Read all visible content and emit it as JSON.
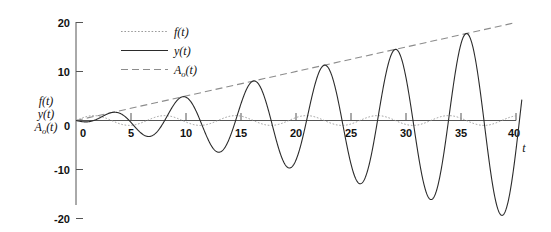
{
  "chart_data": {
    "type": "line",
    "title": "",
    "xlabel": "t",
    "ylabel": "f(t) y(t) A_o(t)",
    "ylabel_lines": [
      "f(t)",
      "y(t)",
      "A",
      "(t)"
    ],
    "xlim": [
      0,
      40
    ],
    "ylim": [
      -20,
      20
    ],
    "xticks": [
      0,
      5,
      10,
      15,
      20,
      25,
      30,
      35,
      40
    ],
    "yticks": [
      20,
      10,
      0,
      -10,
      -20
    ],
    "xtick_labels": [
      "0",
      "5",
      "10",
      "15",
      "20",
      "25",
      "30",
      "35",
      "40"
    ],
    "ytick_labels": [
      "20",
      "10",
      "0",
      "-10",
      "-20"
    ],
    "grid": false,
    "legend_position": "top-center",
    "legend": [
      {
        "label": "f(t)",
        "style": "dotted",
        "color": "#9a9a9a"
      },
      {
        "label": "y(t)",
        "style": "solid",
        "color": "#2b2b2b"
      },
      {
        "label": "A_o(t)",
        "style": "dashed",
        "color": "#8c8c8c"
      }
    ],
    "annotations": [
      "y(t) is a resonant response whose amplitude grows linearly with t",
      "A_o(t) is the linear amplitude envelope 0.5*t",
      "f(t) is the small forcing input of amplitude about 1"
    ],
    "series": [
      {
        "name": "f(t)",
        "style": "dotted",
        "color": "#9a9a9a",
        "description": "forcing input, amplitude ~1, period ~6.45",
        "formula": "1.0*sin(2*pi*t/6.45)",
        "amplitude": 1.0,
        "period": 6.45,
        "x": [
          0,
          2,
          4,
          6,
          8,
          10,
          12,
          14,
          16,
          18,
          20,
          22,
          24,
          26,
          28,
          30,
          32,
          34,
          36,
          38,
          40
        ],
        "y": [
          0,
          0.93,
          0.69,
          -0.19,
          -0.91,
          -0.86,
          -0.05,
          0.81,
          0.97,
          0.28,
          -0.66,
          -1.0,
          -0.5,
          0.47,
          0.99,
          0.69,
          -0.26,
          -0.94,
          -0.84,
          0.03,
          0.86
        ]
      },
      {
        "name": "y(t)",
        "style": "solid",
        "color": "#2b2b2b",
        "description": "resonant response with linearly growing amplitude reaching 20 at t=40",
        "formula": "-0.5*t*cos(2*pi*t/6.45)",
        "period": 6.45,
        "amplitude_at_40": 20,
        "peaks_t": [
          7.7,
          14.2,
          20.5,
          27.0,
          33.4,
          39.8
        ],
        "peaks_y": [
          3.9,
          7.1,
          10.3,
          13.5,
          16.7,
          19.9
        ],
        "troughs_t": [
          4.6,
          11.0,
          17.4,
          23.8,
          30.2,
          36.6
        ],
        "troughs_y": [
          -2.3,
          -5.5,
          -8.7,
          -11.9,
          -15.1,
          -18.3
        ],
        "x": [
          0,
          2,
          4,
          6,
          8,
          10,
          12,
          14,
          16,
          18,
          20,
          22,
          24,
          26,
          28,
          30,
          32,
          34,
          36,
          38,
          40
        ],
        "y": [
          0,
          -0.37,
          1.45,
          2.84,
          -1.66,
          -2.57,
          5.98,
          5.49,
          -4.0,
          -8.9,
          3.1,
          10.7,
          1.6,
          -12.6,
          -7.8,
          11.3,
          14.4,
          -5.9,
          -17.3,
          -1.6,
          18.1
        ]
      },
      {
        "name": "A_o(t)",
        "style": "dashed",
        "color": "#8c8c8c",
        "description": "linear envelope through the peaks of y(t)",
        "formula": "0.5*t",
        "x": [
          0,
          40
        ],
        "y": [
          0,
          20
        ]
      }
    ]
  },
  "axes": {
    "x_axis_label": "t",
    "y_axis_label_parts": {
      "line1": "f(t)",
      "line2": "y(t)",
      "line3_base": "A",
      "line3_sub": "o",
      "line3_tail": "(t)"
    }
  },
  "legend_entries": {
    "f": "f(t)",
    "y": "y(t)",
    "a_base": "A",
    "a_sub": "o",
    "a_tail": "(t)"
  },
  "colors": {
    "solid": "#2b2b2b",
    "dashed": "#8c8c8c",
    "dotted": "#9a9a9a",
    "axis": "#555555",
    "background": "#ffffff"
  }
}
